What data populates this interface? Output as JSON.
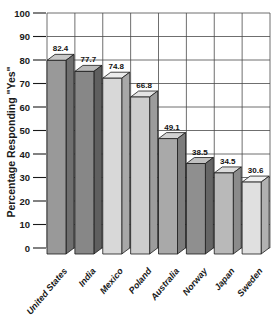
{
  "chart_data": {
    "type": "bar",
    "style": "3d-grayscale",
    "title": "",
    "xlabel": "",
    "ylabel": "Percentage Responding \"Yes\"",
    "categories": [
      "United States",
      "India",
      "Mexico",
      "Poland",
      "Australia",
      "Norway",
      "Japan",
      "Sweden"
    ],
    "values": [
      82.4,
      77.7,
      74.8,
      66.8,
      49.1,
      38.5,
      34.5,
      30.6
    ],
    "ylim": [
      0,
      100
    ],
    "y_ticks": [
      0,
      10,
      20,
      30,
      40,
      50,
      60,
      70,
      80,
      90,
      100
    ],
    "grid": "full",
    "legend": "none",
    "colors": {
      "grid_line": "#4a4a4a",
      "tick_line": "#1a1a1a",
      "bar_outline": "#1a1a1a",
      "text": "#1a1a1a",
      "background": "#ffffff",
      "bar_faces": [
        {
          "front": "#999999",
          "top": "#c8c8c8",
          "side": "#6f6f6f"
        },
        {
          "front": "#878787",
          "top": "#b9b9b9",
          "side": "#5f5f5f"
        },
        {
          "front": "#d8d8d8",
          "top": "#ececec",
          "side": "#a8a8a8"
        },
        {
          "front": "#cdcdcd",
          "top": "#e4e4e4",
          "side": "#9c9c9c"
        },
        {
          "front": "#a9a9a9",
          "top": "#d2d2d2",
          "side": "#7c7c7c"
        },
        {
          "front": "#8f8f8f",
          "top": "#c0c0c0",
          "side": "#666666"
        },
        {
          "front": "#b9b9b9",
          "top": "#dcdcdc",
          "side": "#8b8b8b"
        },
        {
          "front": "#e0e0e0",
          "top": "#f1f1f1",
          "side": "#b1b1b1"
        }
      ]
    }
  }
}
